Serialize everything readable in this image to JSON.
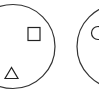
{
  "diagram": {
    "stroke_color": "#333333",
    "background": "#ffffff",
    "panels": [
      {
        "id": "left",
        "outer_shape": "circle",
        "contents": [
          {
            "shape": "square"
          },
          {
            "shape": "triangle"
          }
        ]
      },
      {
        "id": "right",
        "outer_shape": "circle",
        "contents": [
          {
            "shape": "circle"
          }
        ]
      }
    ]
  }
}
